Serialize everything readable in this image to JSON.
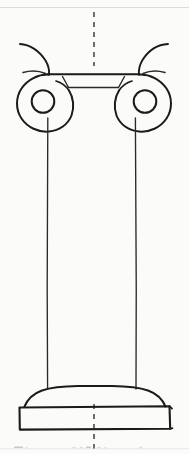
{
  "image": {
    "kind": "hand-drawn-technical-sketch",
    "subject": "Ionic column elevation",
    "width": 189,
    "height": 454,
    "background_color": "#fbfbfa",
    "ink_color": "#1b1b1b",
    "faint_rule_color": "#dcdcdc"
  },
  "drawing": {
    "title": "Ionic Column Elevation",
    "parts": [
      {
        "id": "centerline",
        "label": "Vertical axis centerline",
        "style": "dashed",
        "color": "#242424",
        "x": 94,
        "y_top": 10,
        "y_bottom": 454
      },
      {
        "id": "volute-left",
        "label": "Left volute scroll",
        "center_x": 43,
        "center_y": 99,
        "outer_radius": 27,
        "eye_radius": 11
      },
      {
        "id": "volute-right",
        "label": "Right volute scroll",
        "center_x": 143,
        "center_y": 99,
        "outer_radius": 27,
        "eye_radius": 11
      },
      {
        "id": "volute-tail-left",
        "label": "Left volute outer tendril",
        "color": "#1b1b1b"
      },
      {
        "id": "volute-tail-right",
        "label": "Right volute outer tendril",
        "color": "#1b1b1b"
      },
      {
        "id": "abacus",
        "label": "Abacus band between volutes",
        "x_left": 44,
        "x_right": 143,
        "y_top": 74,
        "y_bottom": 88
      },
      {
        "id": "shaft",
        "label": "Column shaft",
        "x_left": 47,
        "x_right": 136,
        "y_top": 118,
        "y_bottom": 389
      },
      {
        "id": "torus",
        "label": "Torus base moulding",
        "y_top": 389,
        "y_bottom": 406
      },
      {
        "id": "plinth",
        "label": "Square plinth block",
        "x_left": 19,
        "x_right": 170,
        "y_top": 406,
        "y_bottom": 429
      }
    ],
    "annotations": {
      "top_rule_label": "",
      "bottom_caption_label": ""
    }
  }
}
